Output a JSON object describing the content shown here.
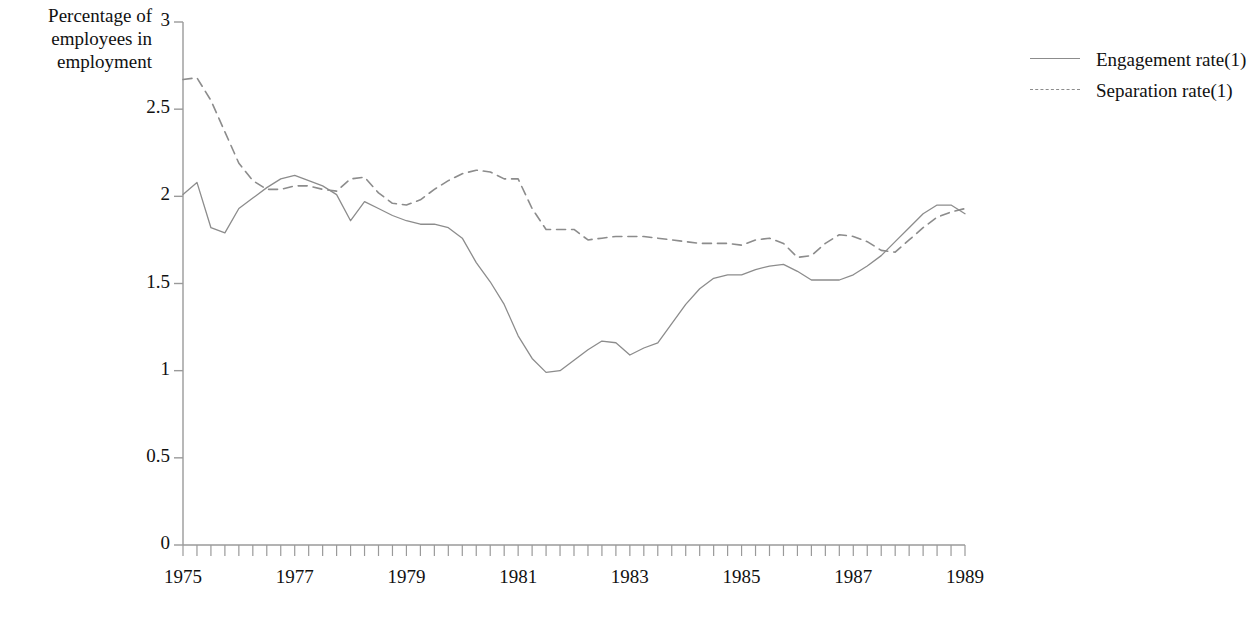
{
  "chart_data": {
    "type": "line",
    "title": "",
    "subtitle": "",
    "xlabel": "",
    "ylabel": "Percentage of employees in employment",
    "ylabel_lines": [
      "Percentage of",
      "employees in",
      "employment"
    ],
    "ylim": [
      0,
      3
    ],
    "ytick_labels": [
      "3",
      "2.5",
      "2",
      "1.5",
      "1",
      "0.5",
      "0"
    ],
    "ytick_values": [
      3,
      2.5,
      2,
      1.5,
      1,
      0.5,
      0
    ],
    "xlim": [
      1975,
      1989
    ],
    "xtick_labels": [
      "1975",
      "1977",
      "1979",
      "1981",
      "1983",
      "1985",
      "1987",
      "1989"
    ],
    "xtick_values": [
      1975,
      1977,
      1979,
      1981,
      1983,
      1985,
      1987,
      1989
    ],
    "x_minor_tick_interval_years": 0.25,
    "x_note": "quarterly observations; minor ticks every quarter, labels every two years",
    "grid": false,
    "legend_position": "right",
    "x": [
      1975.0,
      1975.25,
      1975.5,
      1975.75,
      1976.0,
      1976.25,
      1976.5,
      1976.75,
      1977.0,
      1977.25,
      1977.5,
      1977.75,
      1978.0,
      1978.25,
      1978.5,
      1978.75,
      1979.0,
      1979.25,
      1979.5,
      1979.75,
      1980.0,
      1980.25,
      1980.5,
      1980.75,
      1981.0,
      1981.25,
      1981.5,
      1981.75,
      1982.0,
      1982.25,
      1982.5,
      1982.75,
      1983.0,
      1983.25,
      1983.5,
      1983.75,
      1984.0,
      1984.25,
      1984.5,
      1984.75,
      1985.0,
      1985.25,
      1985.5,
      1985.75,
      1986.0,
      1986.25,
      1986.5,
      1986.75,
      1987.0,
      1987.25,
      1987.5,
      1987.75,
      1988.0,
      1988.25,
      1988.5,
      1988.75,
      1989.0
    ],
    "series": [
      {
        "name": "Engagement rate(1)",
        "style": "solid",
        "color": "#8c8c8c",
        "values": [
          2.01,
          2.08,
          1.82,
          1.79,
          1.93,
          1.99,
          2.05,
          2.1,
          2.12,
          2.09,
          2.06,
          2.01,
          1.86,
          1.97,
          1.93,
          1.89,
          1.86,
          1.84,
          1.84,
          1.82,
          1.76,
          1.62,
          1.51,
          1.38,
          1.2,
          1.07,
          0.99,
          1.0,
          1.06,
          1.12,
          1.17,
          1.16,
          1.09,
          1.13,
          1.16,
          1.27,
          1.38,
          1.47,
          1.53,
          1.55,
          1.55,
          1.58,
          1.6,
          1.61,
          1.57,
          1.52,
          1.52,
          1.52,
          1.55,
          1.6,
          1.66,
          1.74,
          1.82,
          1.9,
          1.95,
          1.95,
          1.9
        ]
      },
      {
        "name": "Separation rate(1)",
        "style": "dashed",
        "color": "#8c8c8c",
        "values": [
          2.67,
          2.68,
          2.55,
          2.37,
          2.19,
          2.09,
          2.04,
          2.04,
          2.06,
          2.06,
          2.04,
          2.03,
          2.1,
          2.11,
          2.02,
          1.96,
          1.95,
          1.98,
          2.04,
          2.09,
          2.13,
          2.15,
          2.14,
          2.1,
          2.1,
          1.93,
          1.81,
          1.81,
          1.81,
          1.75,
          1.76,
          1.77,
          1.77,
          1.77,
          1.76,
          1.75,
          1.74,
          1.73,
          1.73,
          1.73,
          1.72,
          1.75,
          1.76,
          1.73,
          1.65,
          1.66,
          1.73,
          1.78,
          1.77,
          1.74,
          1.69,
          1.68,
          1.75,
          1.82,
          1.88,
          1.91,
          1.93
        ]
      }
    ],
    "legend_entries": [
      "Engagement rate(1)",
      "Separation rate(1)"
    ]
  },
  "legend": {
    "items": [
      {
        "label": "Engagement rate(1)",
        "icon": "solid-line-icon"
      },
      {
        "label": "Separation rate(1)",
        "icon": "dashed-line-icon"
      }
    ]
  },
  "colors": {
    "background": "#ffffff",
    "axis": "#9a9a9a",
    "line": "#8c8c8c",
    "text": "#111111"
  }
}
